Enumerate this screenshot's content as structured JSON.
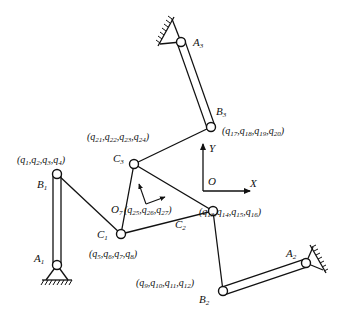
{
  "diagram": {
    "type": "mechanism-schematic",
    "colors": {
      "stroke": "#111111",
      "background": "#ffffff"
    },
    "frame": {
      "origin": "O",
      "x_axis": "X",
      "y_axis": "Y"
    },
    "joints": {
      "A1": {
        "name": "A",
        "sub": "1"
      },
      "A2": {
        "name": "A",
        "sub": "2"
      },
      "A3": {
        "name": "A",
        "sub": "3"
      },
      "B1": {
        "name": "B",
        "sub": "1"
      },
      "B2": {
        "name": "B",
        "sub": "2"
      },
      "B3": {
        "name": "B",
        "sub": "3"
      },
      "C1": {
        "name": "C",
        "sub": "1"
      },
      "C2": {
        "name": "C",
        "sub": "2"
      },
      "C3": {
        "name": "C",
        "sub": "3"
      },
      "O7": {
        "name": "O",
        "sub": "7"
      }
    },
    "coordinates": {
      "B1": "(q1,q2,q3,q4)",
      "C1": "(q5,q6,q7,q8)",
      "B2": "(q9,q10,q11,q12)",
      "C2": "(q13,q14,q15,q16)",
      "B3": "(q17,q18,q19,q20)",
      "C3": "(q21,q22,q23,q24)",
      "O7": "(q25,q26,q27)"
    },
    "coord_parts": {
      "B1": [
        "1",
        "2",
        "3",
        "4"
      ],
      "C1": [
        "5",
        "6",
        "7",
        "8"
      ],
      "B2": [
        "9",
        "10",
        "11",
        "12"
      ],
      "C2": [
        "13",
        "14",
        "15",
        "16"
      ],
      "B3": [
        "17",
        "18",
        "19",
        "20"
      ],
      "C3": [
        "21",
        "22",
        "23",
        "24"
      ],
      "O7": [
        "25",
        "26",
        "27"
      ]
    },
    "links": [
      {
        "from": "A1",
        "to": "B1",
        "kind": "bar"
      },
      {
        "from": "B1",
        "to": "C1",
        "kind": "line"
      },
      {
        "from": "A2",
        "to": "B2",
        "kind": "bar"
      },
      {
        "from": "B2",
        "to": "C2",
        "kind": "line"
      },
      {
        "from": "A3",
        "to": "B3",
        "kind": "bar"
      },
      {
        "from": "B3",
        "to": "C3",
        "kind": "line"
      },
      {
        "from": "C1",
        "to": "C2",
        "kind": "platform"
      },
      {
        "from": "C2",
        "to": "C3",
        "kind": "platform"
      },
      {
        "from": "C3",
        "to": "C1",
        "kind": "platform"
      }
    ]
  }
}
